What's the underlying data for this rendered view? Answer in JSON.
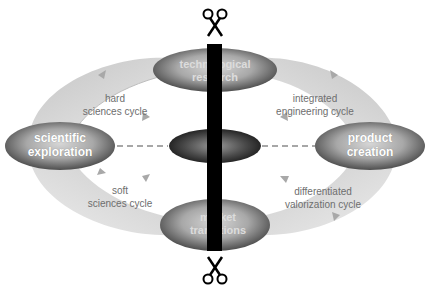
{
  "diagram": {
    "nodes": {
      "top": {
        "line1": "technological",
        "line2": "research"
      },
      "left": {
        "line1": "scientific",
        "line2": "exploration"
      },
      "right": {
        "line1": "product",
        "line2": "creation"
      },
      "bottom": {
        "line1": "market",
        "line2": "transitions"
      },
      "center": {
        "label": ""
      }
    },
    "cycles": {
      "top_left": {
        "line1": "hard",
        "line2": "sciences cycle"
      },
      "top_right": {
        "line1": "integrated",
        "line2": "engineering cycle"
      },
      "bottom_left": {
        "line1": "soft",
        "line2": "sciences cycle"
      },
      "bottom_right": {
        "line1": "differentiated",
        "line2": "valorization cycle"
      }
    },
    "icons": {
      "top_scissors": "scissors-icon",
      "bottom_scissors": "scissors-icon"
    },
    "colors": {
      "cut_bar": "#000000",
      "cycle_fill": "#d9d9d9",
      "node_dark": "#5a5a5a",
      "node_light": "#c8c8c8",
      "dashed_line": "#8a8a8a"
    }
  }
}
